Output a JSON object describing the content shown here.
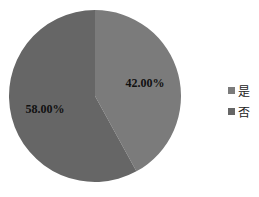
{
  "chart_data": {
    "type": "pie",
    "title": "",
    "categories": [
      "是",
      "否"
    ],
    "values": [
      42.0,
      58.0
    ],
    "labels": [
      "42.00%",
      "58.00%"
    ],
    "colors": [
      "#7b7b7b",
      "#666666"
    ],
    "start_angle_deg": 0,
    "direction": "clockwise",
    "legend_position": "right"
  },
  "legend": {
    "items": [
      {
        "label": "是",
        "color": "#7b7b7b"
      },
      {
        "label": "否",
        "color": "#666666"
      }
    ]
  }
}
